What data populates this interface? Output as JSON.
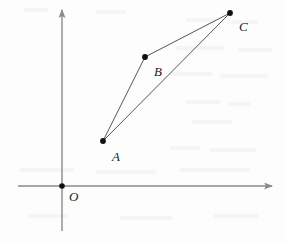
{
  "figure": {
    "name": "vector-triangle-diagram",
    "width": 285,
    "height": 244,
    "background_color": "#fdfdfd",
    "axis_color": "#8a8a8a",
    "line_color": "#555555",
    "point_color": "#111111",
    "label_color": "#1b1b1b"
  },
  "axes": {
    "x_axis": {
      "label": "",
      "y": 186,
      "x_start": 18,
      "x_end": 272,
      "arrow": "right"
    },
    "y_axis": {
      "label": "",
      "x": 62,
      "y_start": 231,
      "y_end": 10,
      "arrow": "up"
    },
    "origin": {
      "label": "O",
      "x": 62,
      "y": 186,
      "label_x": 69,
      "label_y": 190
    }
  },
  "chart_data": {
    "type": "scatter",
    "title": "",
    "xlabel": "",
    "ylabel": "",
    "grid": false,
    "legend": "none",
    "axis_origin_label": "O",
    "points": [
      {
        "label": "A",
        "px": 103,
        "py": 141,
        "label_px": 112,
        "label_py": 150
      },
      {
        "label": "B",
        "px": 145,
        "py": 57,
        "label_px": 154,
        "label_py": 65
      },
      {
        "label": "C",
        "px": 230,
        "py": 13,
        "label_px": 239,
        "label_py": 20
      }
    ],
    "segments": [
      {
        "name": "A-to-B",
        "from": "A",
        "to": "B"
      },
      {
        "name": "B-to-C",
        "from": "B",
        "to": "C"
      },
      {
        "name": "A-to-C",
        "from": "A",
        "to": "C"
      }
    ]
  }
}
